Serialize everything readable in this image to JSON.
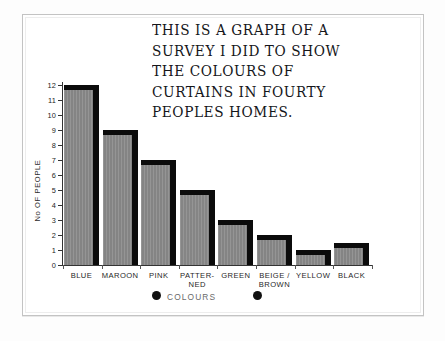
{
  "title": {
    "lines": [
      "THIS IS A GRAPH OF A",
      "SURVEY I DID TO SHOW",
      "THE COLOURS  OF",
      "CURTAINS IN FOURTY",
      "PEOPLES HOMES."
    ],
    "full_text": "THIS IS A GRAPH OF A SURVEY I DID TO SHOW THE COLOURS OF CURTAINS IN FOURTY PEOPLES HOMES."
  },
  "axes": {
    "y_title": "No OF PEOPLE",
    "x_title": "COLOURS",
    "y_ticks": [
      "0",
      "1",
      "2",
      "3",
      "4",
      "5",
      "6",
      "7",
      "8",
      "9",
      "10",
      "11",
      "12"
    ]
  },
  "chart_data": {
    "type": "bar",
    "title": "THIS IS A GRAPH OF A SURVEY I DID TO SHOW THE COLOURS OF CURTAINS IN FOURTY PEOPLES HOMES.",
    "xlabel": "COLOURS",
    "ylabel": "No OF PEOPLE",
    "ylim": [
      0,
      12
    ],
    "yticks": [
      0,
      1,
      2,
      3,
      4,
      5,
      6,
      7,
      8,
      9,
      10,
      11,
      12
    ],
    "grid": false,
    "legend": "none",
    "categories": [
      "BLUE",
      "MAROON",
      "PINK",
      "PATTER-\nNED",
      "GREEN",
      "BEIGE /\nBROWN",
      "YELLOW",
      "BLACK"
    ],
    "values": [
      12,
      9,
      7,
      5,
      3,
      2,
      1,
      1.5
    ],
    "bar_fill_styles": [
      "grey",
      "grey2",
      "grey3",
      "pattern",
      "grey4",
      "light",
      "yellow",
      "black"
    ]
  },
  "colors": {
    "bar_grey": "#8b8b8b",
    "bar_shadow": "#0b0b0b",
    "bar_yellow": "#e6e6e2",
    "bar_black": "#0d0d0d",
    "axis": "#333333",
    "paper": "#ffffff",
    "frame": "#c3c3c3",
    "ink": "#15161a"
  }
}
